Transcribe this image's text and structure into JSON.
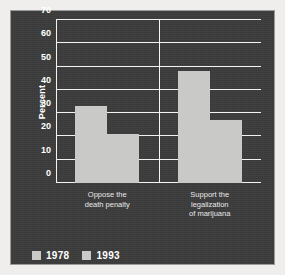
{
  "chart_data": {
    "type": "bar",
    "title": "",
    "xlabel": "",
    "ylabel": "Percent",
    "ylim": [
      0,
      70
    ],
    "yticks": [
      0,
      10,
      20,
      30,
      40,
      50,
      60,
      70
    ],
    "ytick_labels": [
      "0",
      "10",
      "20",
      "30",
      "40",
      "50",
      "60",
      "70"
    ],
    "grid": true,
    "legend_position": "bottom-left",
    "categories": [
      "Oppose the\ndeath penalty",
      "Support the\nlegalization\nof marijuana"
    ],
    "series": [
      {
        "name": "1978",
        "values": [
          33,
          48
        ]
      },
      {
        "name": "1993",
        "values": [
          21,
          27
        ]
      }
    ],
    "colors": {
      "bar": "#c9c9c7",
      "panel_background": "#3b3b3b",
      "gridline": "#f2f2f2",
      "text": "#ffffff",
      "figure_background": "#efeeec"
    }
  }
}
